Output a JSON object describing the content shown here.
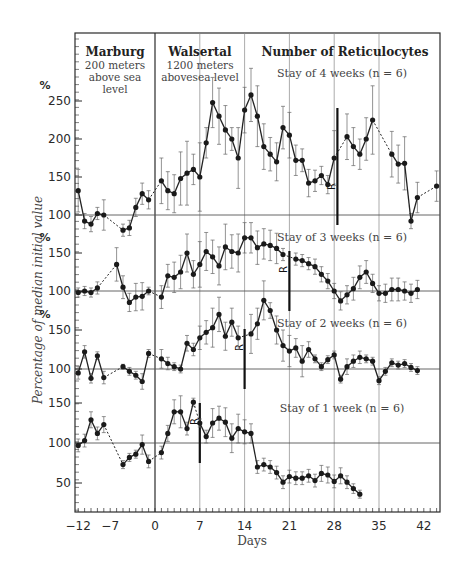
{
  "chart_data": {
    "type": "line",
    "title": "Number of Reticulocytes",
    "xlabel": "Days",
    "ylabel": "Percentage of median initial value",
    "x_ticks": [
      -12,
      -7,
      0,
      7,
      14,
      21,
      28,
      35,
      42
    ],
    "xlim": [
      -12,
      44
    ],
    "regions": [
      {
        "name": "Marburg",
        "subtitle": [
          "200 meters",
          "above sea",
          "level"
        ],
        "x_start": -12,
        "x_end": 0
      },
      {
        "name": "Walsertal",
        "subtitle": [
          "1200 meters",
          "abovesea level"
        ],
        "x_start": 0,
        "x_end": 14
      }
    ],
    "reference_line": 100,
    "panels": [
      {
        "label": "Stay of 4 weeks  (n = 6)",
        "unit": "%",
        "y_ticks": [
          100,
          150,
          200,
          250
        ],
        "return_day": 28.5,
        "return_marker": "R",
        "points": [
          {
            "x": -12,
            "y": 132,
            "err": 28
          },
          {
            "x": -11,
            "y": 92,
            "err": 10
          },
          {
            "x": -10,
            "y": 88,
            "err": 10
          },
          {
            "x": -9,
            "y": 102,
            "err": 8
          },
          {
            "x": -8,
            "y": 100,
            "err": 20
          },
          {
            "x": -5,
            "y": 80,
            "err": 8
          },
          {
            "x": -4,
            "y": 83,
            "err": 10
          },
          {
            "x": -3,
            "y": 110,
            "err": 12
          },
          {
            "x": -2,
            "y": 128,
            "err": 14
          },
          {
            "x": -1,
            "y": 120,
            "err": 12
          },
          {
            "x": 1,
            "y": 145,
            "err": 30
          },
          {
            "x": 2,
            "y": 132,
            "err": 25
          },
          {
            "x": 3,
            "y": 128,
            "err": 25
          },
          {
            "x": 4,
            "y": 148,
            "err": 35
          },
          {
            "x": 5,
            "y": 155,
            "err": 42
          },
          {
            "x": 6,
            "y": 160,
            "err": 20
          },
          {
            "x": 7,
            "y": 150,
            "err": 45
          },
          {
            "x": 8,
            "y": 195,
            "err": 20
          },
          {
            "x": 9,
            "y": 248,
            "err": 33
          },
          {
            "x": 10,
            "y": 230,
            "err": 37
          },
          {
            "x": 11,
            "y": 212,
            "err": 32
          },
          {
            "x": 12,
            "y": 200,
            "err": 15
          },
          {
            "x": 13,
            "y": 175,
            "err": 40
          },
          {
            "x": 14,
            "y": 238,
            "err": 30
          },
          {
            "x": 15,
            "y": 258,
            "err": 35
          },
          {
            "x": 16,
            "y": 230,
            "err": 40
          },
          {
            "x": 17,
            "y": 190,
            "err": 30
          },
          {
            "x": 18,
            "y": 180,
            "err": 22
          },
          {
            "x": 19,
            "y": 170,
            "err": 25
          },
          {
            "x": 20,
            "y": 215,
            "err": 28
          },
          {
            "x": 21,
            "y": 205,
            "err": 30
          },
          {
            "x": 22,
            "y": 172,
            "err": 20
          },
          {
            "x": 23,
            "y": 172,
            "err": 15
          },
          {
            "x": 24,
            "y": 142,
            "err": 18
          },
          {
            "x": 25,
            "y": 145,
            "err": 14
          },
          {
            "x": 26,
            "y": 152,
            "err": 12
          },
          {
            "x": 27,
            "y": 140,
            "err": 12
          },
          {
            "x": 28,
            "y": 175,
            "err": 36
          },
          {
            "x": 30,
            "y": 203,
            "err": 30
          },
          {
            "x": 31,
            "y": 190,
            "err": 25
          },
          {
            "x": 32,
            "y": 180,
            "err": 20
          },
          {
            "x": 33,
            "y": 200,
            "err": 28
          },
          {
            "x": 34,
            "y": 225,
            "err": 45
          },
          {
            "x": 37,
            "y": 180,
            "err": 30
          },
          {
            "x": 38,
            "y": 167,
            "err": 25
          },
          {
            "x": 39,
            "y": 168,
            "err": 35
          },
          {
            "x": 40,
            "y": 92,
            "err": 10
          },
          {
            "x": 41,
            "y": 123,
            "err": 20
          },
          {
            "x": 44,
            "y": 138,
            "err": 20
          }
        ],
        "dashed_gaps": [
          [
            -8,
            -5
          ],
          [
            -1,
            1
          ],
          [
            28,
            30
          ],
          [
            34,
            37
          ],
          [
            41,
            44
          ]
        ]
      },
      {
        "label": "Stay of 3 weeks  (n = 6)",
        "unit": "%",
        "y_ticks": [
          100,
          150
        ],
        "return_day": 21,
        "return_marker": "R",
        "points": [
          {
            "x": -12,
            "y": 98,
            "err": 6
          },
          {
            "x": -11,
            "y": 100,
            "err": 6
          },
          {
            "x": -10,
            "y": 98,
            "err": 6
          },
          {
            "x": -9,
            "y": 104,
            "err": 8
          },
          {
            "x": -6,
            "y": 135,
            "err": 22
          },
          {
            "x": -5,
            "y": 105,
            "err": 15
          },
          {
            "x": -4,
            "y": 85,
            "err": 12
          },
          {
            "x": -3,
            "y": 92,
            "err": 18
          },
          {
            "x": -2,
            "y": 93,
            "err": 18
          },
          {
            "x": -1,
            "y": 100,
            "err": 5
          },
          {
            "x": 1,
            "y": 92,
            "err": 15
          },
          {
            "x": 2,
            "y": 120,
            "err": 15
          },
          {
            "x": 3,
            "y": 118,
            "err": 20
          },
          {
            "x": 4,
            "y": 125,
            "err": 22
          },
          {
            "x": 5,
            "y": 150,
            "err": 25
          },
          {
            "x": 6,
            "y": 122,
            "err": 18
          },
          {
            "x": 7,
            "y": 135,
            "err": 30
          },
          {
            "x": 8,
            "y": 152,
            "err": 25
          },
          {
            "x": 9,
            "y": 145,
            "err": 22
          },
          {
            "x": 10,
            "y": 133,
            "err": 25
          },
          {
            "x": 11,
            "y": 158,
            "err": 30
          },
          {
            "x": 12,
            "y": 152,
            "err": 22
          },
          {
            "x": 13,
            "y": 150,
            "err": 25
          },
          {
            "x": 14,
            "y": 170,
            "err": 20
          },
          {
            "x": 15,
            "y": 170,
            "err": 20
          },
          {
            "x": 16,
            "y": 157,
            "err": 22
          },
          {
            "x": 17,
            "y": 162,
            "err": 20
          },
          {
            "x": 18,
            "y": 160,
            "err": 20
          },
          {
            "x": 19,
            "y": 156,
            "err": 20
          },
          {
            "x": 20,
            "y": 148,
            "err": 8
          },
          {
            "x": 22,
            "y": 142,
            "err": 8
          },
          {
            "x": 23,
            "y": 140,
            "err": 8
          },
          {
            "x": 24,
            "y": 136,
            "err": 8
          },
          {
            "x": 25,
            "y": 132,
            "err": 10
          },
          {
            "x": 26,
            "y": 122,
            "err": 10
          },
          {
            "x": 27,
            "y": 113,
            "err": 10
          },
          {
            "x": 28,
            "y": 100,
            "err": 10
          },
          {
            "x": 29,
            "y": 87,
            "err": 12
          },
          {
            "x": 30,
            "y": 95,
            "err": 12
          },
          {
            "x": 31,
            "y": 103,
            "err": 15
          },
          {
            "x": 32,
            "y": 118,
            "err": 15
          },
          {
            "x": 33,
            "y": 125,
            "err": 15
          },
          {
            "x": 34,
            "y": 110,
            "err": 12
          },
          {
            "x": 35,
            "y": 97,
            "err": 10
          },
          {
            "x": 36,
            "y": 97,
            "err": 12
          },
          {
            "x": 37,
            "y": 102,
            "err": 15
          },
          {
            "x": 38,
            "y": 102,
            "err": 15
          },
          {
            "x": 39,
            "y": 100,
            "err": 12
          },
          {
            "x": 40,
            "y": 97,
            "err": 12
          },
          {
            "x": 41,
            "y": 102,
            "err": 12
          }
        ],
        "dashed_gaps": [
          [
            -9,
            -6
          ],
          [
            -1,
            1
          ],
          [
            20,
            22
          ]
        ]
      },
      {
        "label": "Stay of 2 weeks  (n = 6)",
        "unit": "%",
        "y_ticks": [
          100,
          150
        ],
        "return_day": 14,
        "return_marker": "R",
        "points": [
          {
            "x": -12,
            "y": 95,
            "err": 8
          },
          {
            "x": -11,
            "y": 122,
            "err": 8
          },
          {
            "x": -10,
            "y": 88,
            "err": 6
          },
          {
            "x": -9,
            "y": 117,
            "err": 5
          },
          {
            "x": -8,
            "y": 89,
            "err": 8
          },
          {
            "x": -5,
            "y": 103,
            "err": 3
          },
          {
            "x": -4,
            "y": 97,
            "err": 5
          },
          {
            "x": -3,
            "y": 92,
            "err": 5
          },
          {
            "x": -2,
            "y": 84,
            "err": 10
          },
          {
            "x": -1,
            "y": 120,
            "err": 5
          },
          {
            "x": 1,
            "y": 113,
            "err": 12
          },
          {
            "x": 2,
            "y": 107,
            "err": 8
          },
          {
            "x": 3,
            "y": 103,
            "err": 5
          },
          {
            "x": 4,
            "y": 100,
            "err": 5
          },
          {
            "x": 5,
            "y": 133,
            "err": 10
          },
          {
            "x": 6,
            "y": 125,
            "err": 8
          },
          {
            "x": 7,
            "y": 140,
            "err": 15
          },
          {
            "x": 8,
            "y": 147,
            "err": 15
          },
          {
            "x": 9,
            "y": 153,
            "err": 25
          },
          {
            "x": 10,
            "y": 170,
            "err": 22
          },
          {
            "x": 11,
            "y": 142,
            "err": 18
          },
          {
            "x": 12,
            "y": 160,
            "err": 18
          },
          {
            "x": 13,
            "y": 140,
            "err": 15
          },
          {
            "x": 15,
            "y": 145,
            "err": 25
          },
          {
            "x": 16,
            "y": 158,
            "err": 20
          },
          {
            "x": 17,
            "y": 188,
            "err": 25
          },
          {
            "x": 18,
            "y": 175,
            "err": 10
          },
          {
            "x": 19,
            "y": 150,
            "err": 18
          },
          {
            "x": 20,
            "y": 130,
            "err": 20
          },
          {
            "x": 21,
            "y": 123,
            "err": 20
          },
          {
            "x": 22,
            "y": 127,
            "err": 12
          },
          {
            "x": 23,
            "y": 110,
            "err": 20
          },
          {
            "x": 24,
            "y": 125,
            "err": 10
          },
          {
            "x": 25,
            "y": 113,
            "err": 5
          },
          {
            "x": 26,
            "y": 103,
            "err": 5
          },
          {
            "x": 27,
            "y": 112,
            "err": 5
          },
          {
            "x": 28,
            "y": 118,
            "err": 5
          },
          {
            "x": 29,
            "y": 87,
            "err": 5
          },
          {
            "x": 30,
            "y": 103,
            "err": 10
          },
          {
            "x": 31,
            "y": 110,
            "err": 8
          },
          {
            "x": 32,
            "y": 115,
            "err": 8
          },
          {
            "x": 33,
            "y": 113,
            "err": 5
          },
          {
            "x": 34,
            "y": 110,
            "err": 5
          },
          {
            "x": 35,
            "y": 85,
            "err": 5
          },
          {
            "x": 36,
            "y": 97,
            "err": 5
          },
          {
            "x": 37,
            "y": 108,
            "err": 5
          },
          {
            "x": 38,
            "y": 105,
            "err": 5
          },
          {
            "x": 39,
            "y": 107,
            "err": 5
          },
          {
            "x": 40,
            "y": 102,
            "err": 5
          },
          {
            "x": 41,
            "y": 98,
            "err": 5
          }
        ],
        "dashed_gaps": [
          [
            -8,
            -5
          ],
          [
            -1,
            1
          ],
          [
            13,
            15
          ]
        ]
      },
      {
        "label": "Stay of 1 week  (n = 6)",
        "unit": "",
        "y_ticks": [
          50,
          100,
          150
        ],
        "return_day": 7,
        "return_marker": "R",
        "points": [
          {
            "x": -12,
            "y": 97,
            "err": 8
          },
          {
            "x": -11,
            "y": 103,
            "err": 8
          },
          {
            "x": -10,
            "y": 129,
            "err": 10
          },
          {
            "x": -9,
            "y": 112,
            "err": 8
          },
          {
            "x": -8,
            "y": 123,
            "err": 10
          },
          {
            "x": -5,
            "y": 73,
            "err": 5
          },
          {
            "x": -4,
            "y": 82,
            "err": 5
          },
          {
            "x": -3,
            "y": 86,
            "err": 5
          },
          {
            "x": -2,
            "y": 98,
            "err": 12
          },
          {
            "x": -1,
            "y": 77,
            "err": 8
          },
          {
            "x": 1,
            "y": 88,
            "err": 8
          },
          {
            "x": 2,
            "y": 112,
            "err": 10
          },
          {
            "x": 3,
            "y": 139,
            "err": 15
          },
          {
            "x": 4,
            "y": 139,
            "err": 20
          },
          {
            "x": 5,
            "y": 118,
            "err": 8
          },
          {
            "x": 6,
            "y": 151,
            "err": 5
          },
          {
            "x": 7,
            "y": 125,
            "err": 5
          },
          {
            "x": 8,
            "y": 108,
            "err": 8
          },
          {
            "x": 9,
            "y": 125,
            "err": 18
          },
          {
            "x": 10,
            "y": 131,
            "err": 15
          },
          {
            "x": 11,
            "y": 126,
            "err": 18
          },
          {
            "x": 12,
            "y": 106,
            "err": 18
          },
          {
            "x": 13,
            "y": 118,
            "err": 18
          },
          {
            "x": 14,
            "y": 114,
            "err": 15
          },
          {
            "x": 15,
            "y": 112,
            "err": 12
          },
          {
            "x": 16,
            "y": 70,
            "err": 8
          },
          {
            "x": 17,
            "y": 73,
            "err": 8
          },
          {
            "x": 18,
            "y": 70,
            "err": 8
          },
          {
            "x": 19,
            "y": 63,
            "err": 8
          },
          {
            "x": 20,
            "y": 51,
            "err": 8
          },
          {
            "x": 21,
            "y": 58,
            "err": 8
          },
          {
            "x": 22,
            "y": 56,
            "err": 8
          },
          {
            "x": 23,
            "y": 56,
            "err": 8
          },
          {
            "x": 24,
            "y": 59,
            "err": 8
          },
          {
            "x": 25,
            "y": 53,
            "err": 8
          },
          {
            "x": 26,
            "y": 62,
            "err": 10
          },
          {
            "x": 27,
            "y": 60,
            "err": 10
          },
          {
            "x": 28,
            "y": 52,
            "err": 8
          },
          {
            "x": 29,
            "y": 59,
            "err": 10
          },
          {
            "x": 30,
            "y": 51,
            "err": 8
          },
          {
            "x": 31,
            "y": 43,
            "err": 6
          },
          {
            "x": 32,
            "y": 36,
            "err": 5
          }
        ],
        "dashed_gaps": [
          [
            -8,
            -5
          ],
          [
            -1,
            1
          ],
          [
            6,
            7
          ]
        ]
      }
    ]
  }
}
